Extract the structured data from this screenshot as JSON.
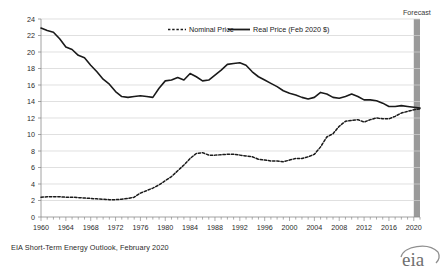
{
  "chart_data": {
    "type": "line",
    "title": "",
    "xlabel": "",
    "ylabel": "",
    "xlim": [
      1960,
      2021
    ],
    "ylim": [
      0,
      24
    ],
    "y_ticks": [
      0,
      2,
      4,
      6,
      8,
      10,
      12,
      14,
      16,
      18,
      20,
      22,
      24
    ],
    "x_ticks": [
      1960,
      1964,
      1968,
      1972,
      1976,
      1980,
      1984,
      1988,
      1992,
      1996,
      2000,
      2004,
      2008,
      2012,
      2016,
      2020
    ],
    "grid": "horizontal",
    "legend_position": "top-center",
    "annotations": [
      {
        "text": "Forecast",
        "x_start": 2020,
        "x_end": 2021,
        "shade_color": "#9a9a9a"
      }
    ],
    "x": [
      1960,
      1961,
      1962,
      1963,
      1964,
      1965,
      1966,
      1967,
      1968,
      1969,
      1970,
      1971,
      1972,
      1973,
      1974,
      1975,
      1976,
      1977,
      1978,
      1979,
      1980,
      1981,
      1982,
      1983,
      1984,
      1985,
      1986,
      1987,
      1988,
      1989,
      1990,
      1991,
      1992,
      1993,
      1994,
      1995,
      1996,
      1997,
      1998,
      1999,
      2000,
      2001,
      2002,
      2003,
      2004,
      2005,
      2006,
      2007,
      2008,
      2009,
      2010,
      2011,
      2012,
      2013,
      2014,
      2015,
      2016,
      2017,
      2018,
      2019,
      2020,
      2021
    ],
    "series": [
      {
        "name": "Real Price (Feb 2020 $)",
        "style": "solid",
        "color": "#1a1a1a",
        "values": [
          22.9,
          22.6,
          22.4,
          21.6,
          20.6,
          20.3,
          19.6,
          19.3,
          18.4,
          17.6,
          16.7,
          16.1,
          15.2,
          14.6,
          14.5,
          14.6,
          14.7,
          14.6,
          14.5,
          15.6,
          16.5,
          16.6,
          16.9,
          16.6,
          17.4,
          17.0,
          16.5,
          16.6,
          17.2,
          17.8,
          18.5,
          18.6,
          18.7,
          18.4,
          17.6,
          17.0,
          16.6,
          16.2,
          15.8,
          15.3,
          15.0,
          14.8,
          14.5,
          14.3,
          14.5,
          15.1,
          14.9,
          14.5,
          14.4,
          14.6,
          14.9,
          14.6,
          14.2,
          14.2,
          14.1,
          13.8,
          13.4,
          13.4,
          13.5,
          13.4,
          13.3,
          13.2
        ]
      },
      {
        "name": "Nominal Price",
        "style": "dashed",
        "color": "#1a1a1a",
        "values": [
          2.4,
          2.45,
          2.45,
          2.45,
          2.4,
          2.4,
          2.35,
          2.3,
          2.25,
          2.2,
          2.15,
          2.1,
          2.1,
          2.15,
          2.25,
          2.4,
          2.9,
          3.2,
          3.5,
          3.9,
          4.4,
          4.9,
          5.6,
          6.3,
          7.1,
          7.7,
          7.8,
          7.5,
          7.5,
          7.55,
          7.6,
          7.6,
          7.5,
          7.4,
          7.3,
          7.0,
          6.9,
          6.8,
          6.8,
          6.7,
          6.9,
          7.1,
          7.1,
          7.3,
          7.6,
          8.5,
          9.7,
          10.1,
          11.0,
          11.6,
          11.7,
          11.8,
          11.5,
          11.8,
          12.0,
          11.9,
          11.9,
          12.2,
          12.6,
          12.8,
          13.0,
          13.1
        ]
      }
    ]
  },
  "legend": {
    "entries": [
      {
        "label": "Nominal Price",
        "style": "dashed"
      },
      {
        "label": "Real Price (Feb 2020 $)",
        "style": "solid"
      }
    ]
  },
  "forecast": {
    "label": "Forecast"
  },
  "footer": {
    "source": "EIA Short-Term Energy Outlook, February 2020",
    "logo_text": "eia"
  }
}
